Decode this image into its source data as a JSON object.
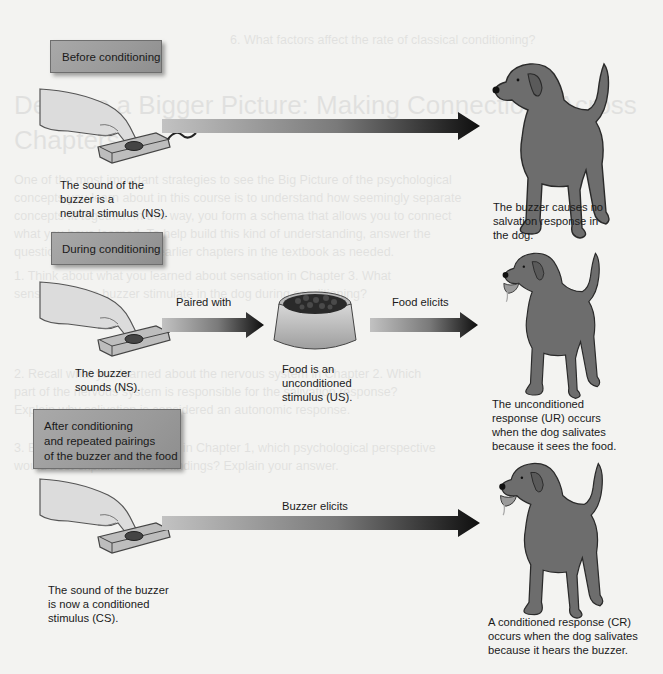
{
  "stages": {
    "before": {
      "label": "Before conditioning",
      "stimulus_caption": [
        "The sound of the",
        "buzzer is a",
        "neutral stimulus (NS)."
      ],
      "response_caption": [
        "The buzzer causes no",
        "salvation response in",
        "the dog."
      ]
    },
    "during": {
      "label": "During conditioning",
      "arrow1_label": "Paired with",
      "arrow2_label": "Food elicits",
      "stimulus_caption": [
        "The buzzer",
        "sounds (NS)."
      ],
      "food_caption": [
        "Food is an",
        "unconditioned",
        "stimulus (US)."
      ],
      "response_caption": [
        "The unconditioned",
        "response (UR) occurs",
        "when the dog salivates",
        "because it sees the food."
      ]
    },
    "after": {
      "label": [
        "After conditioning",
        "and repeated pairings",
        "of the buzzer and the food"
      ],
      "arrow_label": "Buzzer elicits",
      "stimulus_caption": [
        "The sound of the buzzer",
        "is now a conditioned",
        "stimulus (CS)."
      ],
      "response_caption": [
        "A conditioned response (CR)",
        "occurs when the dog salivates",
        "because it hears the buzzer."
      ]
    }
  },
  "ghost_text": {
    "line1": "6.  What factors affect the rate of classical conditioning?",
    "heading1": "Develop a Bigger Picture: Making Connections Across",
    "heading2": "Chapters",
    "p1": "One of the most important strategies to see the Big Picture of the psychological",
    "p2": "concepts you learn about in this course is to understand how seemingly separate",
    "p3": "concepts fit together. In this way, you form a schema that allows you to connect",
    "p4": "what you have learned. To help build this kind of understanding, answer the",
    "p5": "questions below. Refer to earlier chapters in the textbook as needed.",
    "p6": "1. Think about what you learned about sensation in Chapter 3. What",
    "p7": "   sense does the buzzer stimulate in the dog during conditioning?",
    "p8": "2. Recall what you learned about the nervous system in Chapter 2. Which",
    "p9": "   part of the nervous system is responsible for the salivation response?",
    "p10": "   Explain why salivation is considered an autonomic response.",
    "p11": "3. Based on what you learned in Chapter 1, which psychological perspective",
    "p12": "   would best explain Pavlov's findings? Explain your answer."
  },
  "colors": {
    "background": "#f3f3f1",
    "box_fill": "#a3a3a3",
    "dog": "#6b6b6b",
    "arrow_start": "#bdbdbd",
    "arrow_end": "#111111"
  }
}
